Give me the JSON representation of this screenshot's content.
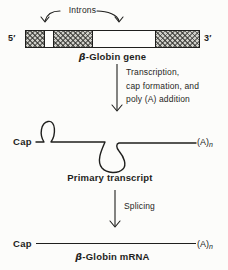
{
  "colors": {
    "background": "#fcfcfa",
    "ink": "#1f1f1d",
    "exon_fill": "#cfcfc9",
    "exon_hatch": "#52524c"
  },
  "gene": {
    "introns_label": "Introns",
    "five_prime": "5′",
    "three_prime": "3′",
    "title_beta": "β",
    "title_rest": "-Globin gene",
    "segments": [
      {
        "type": "exon"
      },
      {
        "type": "intron"
      },
      {
        "type": "exon"
      },
      {
        "type": "intron"
      },
      {
        "type": "exon"
      }
    ]
  },
  "transcription_step": {
    "line1": "Transcription,",
    "line2": "cap formation, and",
    "line3": "poly (A) addition"
  },
  "primary_transcript": {
    "cap": "Cap",
    "poly_a": "(A)",
    "poly_a_sub": "n",
    "title": "Primary transcript"
  },
  "splicing_step": {
    "label": "Splicing"
  },
  "mrna": {
    "cap": "Cap",
    "poly_a": "(A)",
    "poly_a_sub": "n",
    "title_beta": "β",
    "title_rest": "-Globin mRNA"
  }
}
